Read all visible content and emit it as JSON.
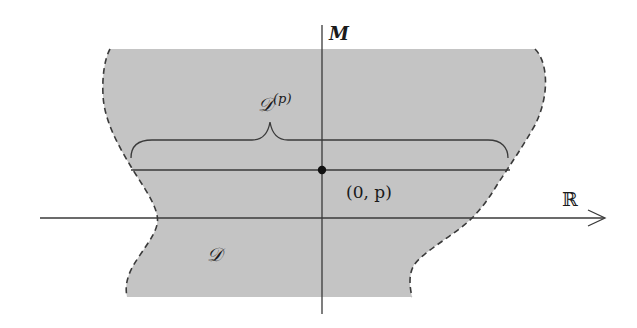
{
  "diagram": {
    "colors": {
      "region_fill": "#c4c4c4",
      "line": "#3a3a3a",
      "boundary_dash": "#3a3a3a",
      "background": "#ffffff"
    },
    "labels": {
      "vertical_axis": "M",
      "horizontal_axis": "ℝ",
      "point": "(0, p)",
      "slice_set_base": "𝒟",
      "slice_set_sup": "(p)",
      "region": "𝒟"
    },
    "elements": {
      "region": "shaded domain D with dashed left and right boundaries",
      "horizontal_axis": "ℝ axis with arrow pointing right",
      "vertical_axis": "M axis",
      "slice_line": "horizontal line through the point (0, p)",
      "brace": "curly brace over the slice line labeled D^(p)",
      "point": "filled dot at (0, p)"
    }
  }
}
